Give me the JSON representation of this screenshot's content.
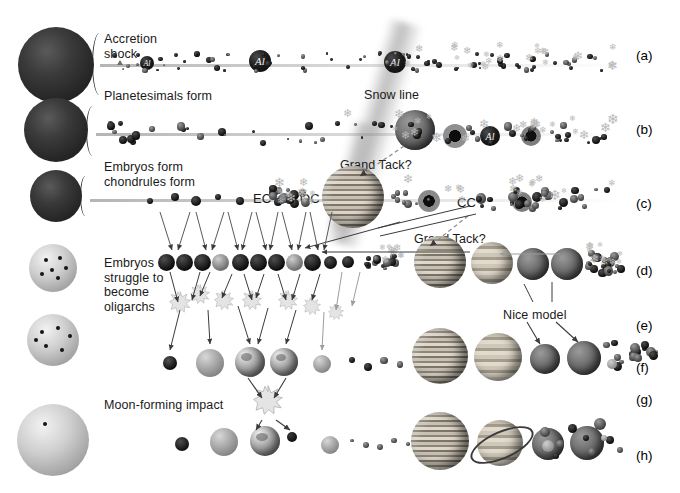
{
  "figure": {
    "background": "#ffffff",
    "width": 680,
    "height": 493
  },
  "row_labels": [
    {
      "id": "a",
      "text": "(a)",
      "x": 636,
      "y": 48
    },
    {
      "id": "b",
      "text": "(b)",
      "x": 636,
      "y": 122
    },
    {
      "id": "c",
      "text": "(c)",
      "x": 636,
      "y": 196
    },
    {
      "id": "d",
      "text": "(d)",
      "x": 636,
      "y": 263
    },
    {
      "id": "e",
      "text": "(e)",
      "x": 636,
      "y": 318
    },
    {
      "id": "f",
      "text": "(f)",
      "x": 636,
      "y": 360
    },
    {
      "id": "g",
      "text": "(g)",
      "x": 636,
      "y": 392
    },
    {
      "id": "h",
      "text": "(h)",
      "x": 636,
      "y": 448
    }
  ],
  "annotations": [
    {
      "name": "accretion-shock",
      "text": "Accretion\nshock",
      "x": 104,
      "y": 32
    },
    {
      "name": "planetesimals-form",
      "text": "Planetesimals form",
      "x": 104,
      "y": 89
    },
    {
      "name": "snow-line",
      "text": "Snow line",
      "x": 364,
      "y": 88
    },
    {
      "name": "embryos-chondrules",
      "text": "Embryos form\nchondrules form",
      "x": 104,
      "y": 160
    },
    {
      "name": "grand-tack-1",
      "text": "Grand Tack?",
      "x": 340,
      "y": 158
    },
    {
      "name": "grand-tack-2",
      "text": "Grand Tack?",
      "x": 414,
      "y": 232
    },
    {
      "name": "ec-label",
      "text": "EC",
      "x": 253,
      "y": 192
    },
    {
      "name": "oc-label",
      "text": "OC",
      "x": 300,
      "y": 192
    },
    {
      "name": "cc-label",
      "text": "CC",
      "x": 457,
      "y": 202
    },
    {
      "name": "embryos-oligarchs",
      "text": "Embryos\nstruggle to\nbecome\noligarchs",
      "x": 104,
      "y": 256
    },
    {
      "name": "nice-model",
      "text": "Nice model",
      "x": 503,
      "y": 308
    },
    {
      "name": "moon-forming-impact",
      "text": "Moon-forming impact",
      "x": 104,
      "y": 398
    }
  ],
  "colors": {
    "ink": "#1a1a1a",
    "protosun": "#262626",
    "sun": "#cfcfcf",
    "snowflake": "#b9b9b9",
    "al_body": "#111111",
    "arrow": "#3b3b3b",
    "burst": "#e4e4e4"
  },
  "rows": {
    "a": {
      "label": "(a)",
      "caption": "Accretion shock",
      "star": {
        "type": "protosun",
        "cx": 56,
        "cy": 65,
        "r": 38
      },
      "al_bodies": [
        {
          "cx": 147,
          "cy": 63,
          "r": 7,
          "text": "Al"
        },
        {
          "cx": 260,
          "cy": 61,
          "r": 11,
          "text": "Al"
        },
        {
          "cx": 395,
          "cy": 62,
          "r": 11,
          "text": "Al"
        }
      ],
      "snowflake_count": 26,
      "dust_count": 72
    },
    "b": {
      "label": "(b)",
      "caption": "Planetesimals form",
      "star": {
        "type": "protosun",
        "cx": 56,
        "cy": 130,
        "r": 32
      },
      "al_bodies": [
        {
          "cx": 490,
          "cy": 136,
          "r": 10,
          "text": "Al"
        }
      ],
      "giant": {
        "name": "proto-jupiter",
        "cx": 415,
        "cy": 130,
        "r": 20
      },
      "snowflake_count": 22
    },
    "c": {
      "label": "(c)",
      "caption": "Embryos form / chondrules form",
      "star": {
        "type": "protosun",
        "cx": 56,
        "cy": 196,
        "r": 26
      },
      "giant": {
        "name": "jupiter-grand-tack",
        "cx": 353,
        "cy": 197,
        "r": 31
      },
      "reservoirs": [
        "EC",
        "OC",
        "CC"
      ],
      "snowflake_count": 24
    },
    "d": {
      "label": "(d)",
      "caption": "Embryos struggle to become oligarchs",
      "star": {
        "type": "sun",
        "cx": 53,
        "cy": 268,
        "r": 24,
        "spots": 6
      },
      "giants": [
        {
          "name": "jupiter",
          "cx": 440,
          "cy": 262,
          "r": 26
        },
        {
          "name": "saturn",
          "cx": 492,
          "cy": 263,
          "r": 21
        },
        {
          "name": "ice-giant-1",
          "cx": 533,
          "cy": 264,
          "r": 16
        },
        {
          "name": "ice-giant-2",
          "cx": 567,
          "cy": 264,
          "r": 16
        }
      ],
      "embryo_count": 11
    },
    "e": {
      "label": "(e)",
      "caption": "Collisions and sweep-up",
      "giants": [
        {
          "name": "jupiter",
          "cx": 440,
          "cy": 287,
          "r": 26
        },
        {
          "name": "saturn",
          "cx": 492,
          "cy": 288,
          "r": 21
        }
      ]
    },
    "f": {
      "label": "(f)",
      "caption": "Nice model reshuffles the ice giants",
      "star": {
        "type": "sun",
        "cx": 53,
        "cy": 340,
        "r": 26,
        "spots": 6
      },
      "inner": [
        {
          "name": "proto-mercury",
          "cx": 170,
          "cy": 363,
          "r": 7
        },
        {
          "name": "proto-venus",
          "cx": 210,
          "cy": 363,
          "r": 14
        },
        {
          "name": "proto-earth",
          "cx": 250,
          "cy": 362,
          "r": 15
        },
        {
          "name": "theia",
          "cx": 284,
          "cy": 362,
          "r": 14
        },
        {
          "name": "proto-mars",
          "cx": 322,
          "cy": 364,
          "r": 9
        }
      ],
      "giants": [
        {
          "name": "jupiter",
          "cx": 440,
          "cy": 356,
          "r": 28
        },
        {
          "name": "saturn",
          "cx": 498,
          "cy": 357,
          "r": 24
        },
        {
          "name": "uranus",
          "cx": 545,
          "cy": 359,
          "r": 15
        },
        {
          "name": "neptune",
          "cx": 584,
          "cy": 358,
          "r": 17
        }
      ]
    },
    "g": {
      "label": "(g)",
      "caption": "Moon-forming impact"
    },
    "h": {
      "label": "(h)",
      "caption": "Present-day Solar System",
      "star": {
        "type": "sun",
        "cx": 53,
        "cy": 440,
        "r": 36,
        "spots": 1
      },
      "inner": [
        {
          "name": "mercury",
          "cx": 182,
          "cy": 444,
          "r": 7
        },
        {
          "name": "venus",
          "cx": 224,
          "cy": 442,
          "r": 14
        },
        {
          "name": "earth",
          "cx": 265,
          "cy": 441,
          "r": 15
        },
        {
          "name": "moon",
          "cx": 292,
          "cy": 437,
          "r": 5
        },
        {
          "name": "mars",
          "cx": 330,
          "cy": 444,
          "r": 9
        }
      ],
      "giants": [
        {
          "name": "jupiter",
          "cx": 440,
          "cy": 441,
          "r": 29
        },
        {
          "name": "saturn",
          "cx": 500,
          "cy": 443,
          "r": 23
        },
        {
          "name": "uranus",
          "cx": 548,
          "cy": 444,
          "r": 16
        },
        {
          "name": "neptune",
          "cx": 587,
          "cy": 443,
          "r": 17
        }
      ],
      "kuiper_count": 9
    }
  }
}
